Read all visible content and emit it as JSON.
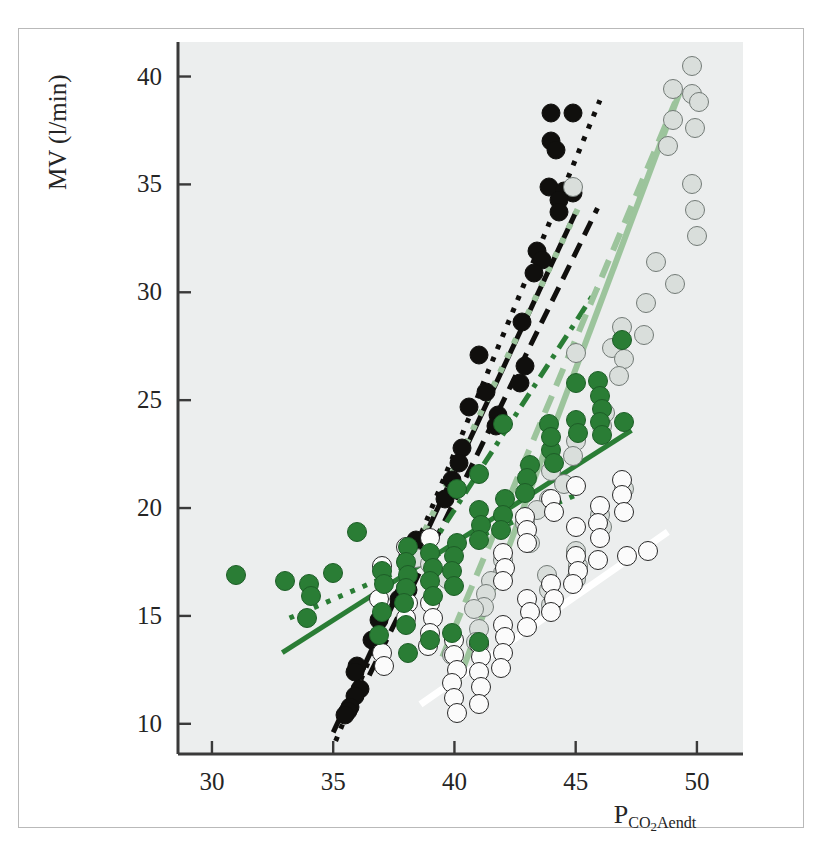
{
  "chart_data": {
    "type": "scatter",
    "title": "",
    "xlabel": "PCO2Aendt",
    "xlabel_main": "P",
    "xlabel_sub_a": "CO",
    "xlabel_sub_num": "2",
    "xlabel_sub_b": "Aendt",
    "ylabel": "MV (l/min)",
    "xlim": [
      28.6,
      51.9
    ],
    "ylim": [
      8.6,
      41.6
    ],
    "xticks": [
      30,
      35,
      40,
      45,
      50
    ],
    "xtick_labels": [
      "30",
      "35",
      "40",
      "45",
      "50"
    ],
    "yticks": [
      10,
      15,
      20,
      25,
      30,
      35,
      40
    ],
    "ytick_labels": [
      "10",
      "15",
      "20",
      "25",
      "30",
      "35",
      "40"
    ],
    "grid": false,
    "legend": "none",
    "plot_background": "#eceeee",
    "colors": {
      "black": "#100f0d",
      "dark_green": "#2a7d35",
      "light_green": "#9cc49c",
      "grey_fill": "#d9dedb",
      "grey_edge": "#727a76",
      "open_fill": "#fbfbfb",
      "open_edge": "#272727",
      "white_line": "#ffffff",
      "frame": "#b9b9b9",
      "axis": "#3a3a3a",
      "text": "#252525"
    },
    "series": [
      {
        "name": "black-filled",
        "marker": "filled-circle",
        "color": "#100f0d",
        "points": [
          [
            44.0,
            38.3
          ],
          [
            44.9,
            38.3
          ],
          [
            44.0,
            37.0
          ],
          [
            44.2,
            36.6
          ],
          [
            43.9,
            34.9
          ],
          [
            44.5,
            34.7
          ],
          [
            44.9,
            34.6
          ],
          [
            44.3,
            34.3
          ],
          [
            44.3,
            33.7
          ],
          [
            43.4,
            31.9
          ],
          [
            43.6,
            31.5
          ],
          [
            43.3,
            30.9
          ],
          [
            42.8,
            28.6
          ],
          [
            41.0,
            27.1
          ],
          [
            42.9,
            26.6
          ],
          [
            42.7,
            25.8
          ],
          [
            41.3,
            25.4
          ],
          [
            40.6,
            24.7
          ],
          [
            41.8,
            24.3
          ],
          [
            41.7,
            23.8
          ],
          [
            40.3,
            22.8
          ],
          [
            40.2,
            22.1
          ],
          [
            39.9,
            21.3
          ],
          [
            39.6,
            20.4
          ],
          [
            38.4,
            18.5
          ],
          [
            38.1,
            17.8
          ],
          [
            38.0,
            17.5
          ],
          [
            38.1,
            16.2
          ],
          [
            37.9,
            15.9
          ],
          [
            37.7,
            15.8
          ],
          [
            36.9,
            14.8
          ],
          [
            36.6,
            13.9
          ],
          [
            36.0,
            12.7
          ],
          [
            35.9,
            12.4
          ],
          [
            36.1,
            11.6
          ],
          [
            35.9,
            11.3
          ],
          [
            35.7,
            10.8
          ],
          [
            35.6,
            10.6
          ],
          [
            35.5,
            10.4
          ]
        ]
      },
      {
        "name": "grey-filled",
        "marker": "grey-circle",
        "color": "#d9dedb",
        "points": [
          [
            49.8,
            40.5
          ],
          [
            49.0,
            39.4
          ],
          [
            49.8,
            39.2
          ],
          [
            50.1,
            38.8
          ],
          [
            49.0,
            38.0
          ],
          [
            49.9,
            37.6
          ],
          [
            48.8,
            36.8
          ],
          [
            49.8,
            35.0
          ],
          [
            44.9,
            34.9
          ],
          [
            49.9,
            33.8
          ],
          [
            50.0,
            32.6
          ],
          [
            48.3,
            31.4
          ],
          [
            49.1,
            30.4
          ],
          [
            47.9,
            29.5
          ],
          [
            46.9,
            28.4
          ],
          [
            47.8,
            28.0
          ],
          [
            46.5,
            27.4
          ],
          [
            47.0,
            26.9
          ],
          [
            46.8,
            26.1
          ],
          [
            45.0,
            27.2
          ],
          [
            46.2,
            24.4
          ],
          [
            46.1,
            23.8
          ],
          [
            45.0,
            23.1
          ],
          [
            44.9,
            22.4
          ],
          [
            44.0,
            21.7
          ],
          [
            44.5,
            21.1
          ],
          [
            43.9,
            20.4
          ],
          [
            43.4,
            19.9
          ],
          [
            42.9,
            19.3
          ],
          [
            43.1,
            18.4
          ],
          [
            42.0,
            17.6
          ],
          [
            42.0,
            17.0
          ],
          [
            41.5,
            16.6
          ],
          [
            41.3,
            16.0
          ],
          [
            41.2,
            15.4
          ],
          [
            40.8,
            15.3
          ],
          [
            41.0,
            14.4
          ],
          [
            40.9,
            13.8
          ],
          [
            39.9,
            13.2
          ],
          [
            43.8,
            16.9
          ],
          [
            43.9,
            16.2
          ],
          [
            44.0,
            15.5
          ],
          [
            45.0,
            18.0
          ],
          [
            45.1,
            17.3
          ],
          [
            45.0,
            16.7
          ],
          [
            46.0,
            19.7
          ],
          [
            46.1,
            19.1
          ],
          [
            47.0,
            20.9
          ],
          [
            38.4,
            17.7
          ],
          [
            39.0,
            17.4
          ],
          [
            39.7,
            16.7
          ]
        ]
      },
      {
        "name": "open-circle",
        "marker": "open-circle",
        "color": "#fbfbfb",
        "points": [
          [
            46.9,
            21.3
          ],
          [
            46.9,
            20.6
          ],
          [
            46.0,
            20.1
          ],
          [
            47.0,
            19.8
          ],
          [
            45.9,
            19.3
          ],
          [
            46.0,
            18.6
          ],
          [
            48.0,
            18.0
          ],
          [
            45.0,
            17.8
          ],
          [
            45.1,
            17.1
          ],
          [
            44.9,
            16.5
          ],
          [
            44.0,
            16.5
          ],
          [
            44.1,
            15.8
          ],
          [
            44.0,
            15.2
          ],
          [
            43.0,
            15.8
          ],
          [
            43.1,
            15.2
          ],
          [
            43.0,
            14.5
          ],
          [
            42.0,
            14.6
          ],
          [
            42.1,
            14.0
          ],
          [
            42.0,
            13.3
          ],
          [
            41.9,
            12.6
          ],
          [
            41.0,
            13.7
          ],
          [
            41.1,
            13.1
          ],
          [
            41.0,
            12.4
          ],
          [
            41.1,
            11.7
          ],
          [
            41.0,
            10.9
          ],
          [
            40.0,
            13.9
          ],
          [
            40.0,
            13.2
          ],
          [
            40.1,
            12.5
          ],
          [
            39.9,
            11.9
          ],
          [
            40.0,
            11.2
          ],
          [
            40.1,
            10.5
          ],
          [
            39.0,
            15.6
          ],
          [
            39.1,
            14.9
          ],
          [
            39.0,
            14.2
          ],
          [
            38.9,
            13.6
          ],
          [
            38.0,
            16.3
          ],
          [
            38.1,
            15.6
          ],
          [
            38.0,
            14.9
          ],
          [
            37.0,
            17.3
          ],
          [
            36.9,
            15.8
          ],
          [
            37.0,
            13.3
          ],
          [
            37.1,
            12.7
          ],
          [
            38.0,
            18.2
          ],
          [
            39.0,
            18.6
          ],
          [
            42.9,
            19.6
          ],
          [
            43.0,
            19.0
          ],
          [
            44.0,
            20.4
          ],
          [
            44.1,
            19.8
          ],
          [
            45.0,
            21.0
          ],
          [
            42.0,
            17.9
          ],
          [
            42.1,
            17.2
          ],
          [
            42.0,
            16.6
          ],
          [
            43.0,
            18.4
          ],
          [
            45.9,
            17.6
          ],
          [
            45.0,
            19.1
          ],
          [
            47.1,
            17.8
          ]
        ]
      },
      {
        "name": "dark-green-filled",
        "marker": "dark-green-circle",
        "color": "#2a7d35",
        "points": [
          [
            46.9,
            27.8
          ],
          [
            45.9,
            25.9
          ],
          [
            45.0,
            25.8
          ],
          [
            46.0,
            25.2
          ],
          [
            46.1,
            24.6
          ],
          [
            46.0,
            24.0
          ],
          [
            46.1,
            23.4
          ],
          [
            45.0,
            24.1
          ],
          [
            45.1,
            23.5
          ],
          [
            44.0,
            22.7
          ],
          [
            44.1,
            22.1
          ],
          [
            43.1,
            22.0
          ],
          [
            43.0,
            21.4
          ],
          [
            42.9,
            20.7
          ],
          [
            42.1,
            20.4
          ],
          [
            42.0,
            19.7
          ],
          [
            41.9,
            19.0
          ],
          [
            41.0,
            19.9
          ],
          [
            41.1,
            19.2
          ],
          [
            41.0,
            18.5
          ],
          [
            40.1,
            18.4
          ],
          [
            40.0,
            17.8
          ],
          [
            39.9,
            17.1
          ],
          [
            40.0,
            16.4
          ],
          [
            39.0,
            17.9
          ],
          [
            39.1,
            17.2
          ],
          [
            39.0,
            16.6
          ],
          [
            39.1,
            15.9
          ],
          [
            38.1,
            18.2
          ],
          [
            38.0,
            17.5
          ],
          [
            38.1,
            16.9
          ],
          [
            38.0,
            16.3
          ],
          [
            37.9,
            15.6
          ],
          [
            37.0,
            17.1
          ],
          [
            37.1,
            16.5
          ],
          [
            37.0,
            15.2
          ],
          [
            36.0,
            18.9
          ],
          [
            35.0,
            17.0
          ],
          [
            34.0,
            16.5
          ],
          [
            34.1,
            15.9
          ],
          [
            33.9,
            14.9
          ],
          [
            33.0,
            16.6
          ],
          [
            31.0,
            16.9
          ],
          [
            42.0,
            23.9
          ],
          [
            41.0,
            21.6
          ],
          [
            43.9,
            23.9
          ],
          [
            44.0,
            23.3
          ],
          [
            40.1,
            20.9
          ],
          [
            47.0,
            24.0
          ],
          [
            38.0,
            14.6
          ],
          [
            38.1,
            13.3
          ],
          [
            39.0,
            13.9
          ],
          [
            39.9,
            14.2
          ],
          [
            41.0,
            13.8
          ],
          [
            36.9,
            14.1
          ]
        ]
      }
    ],
    "trend_lines": [
      {
        "name": "black-dotted",
        "style": "dotted",
        "color": "#100f0d",
        "x0": 35.1,
        "y0": 9.2,
        "x1": 46.0,
        "y1": 38.9
      },
      {
        "name": "black-solid",
        "style": "solid",
        "color": "#100f0d",
        "x0": 35.0,
        "y0": 9.6,
        "x1": 45.0,
        "y1": 33.7
      },
      {
        "name": "black-dashed",
        "style": "dashed",
        "color": "#100f0d",
        "x0": 35.6,
        "y0": 10.2,
        "x1": 45.9,
        "y1": 33.9
      },
      {
        "name": "dark-green-dotted",
        "style": "dotted",
        "color": "#2a7d35",
        "x0": 33.2,
        "y0": 14.9,
        "x1": 45.0,
        "y1": 20.6
      },
      {
        "name": "dark-green-solid",
        "style": "solid",
        "color": "#2a7d35",
        "x0": 32.9,
        "y0": 13.3,
        "x1": 47.3,
        "y1": 23.6
      },
      {
        "name": "dark-green-dashdot",
        "style": "dashdot",
        "color": "#2a7d35",
        "x0": 38.9,
        "y0": 18.0,
        "x1": 45.9,
        "y1": 30.2
      },
      {
        "name": "light-green-dotted",
        "style": "dotted",
        "color": "#9cc49c",
        "x0": 38.5,
        "y0": 18.3,
        "x1": 45.1,
        "y1": 33.9
      },
      {
        "name": "light-green-solid",
        "style": "solid",
        "color": "#9cc49c",
        "x0": 39.9,
        "y0": 11.2,
        "x1": 49.3,
        "y1": 39.3
      },
      {
        "name": "light-green-dashed",
        "style": "dashed",
        "color": "#9cc49c",
        "x0": 39.5,
        "y0": 13.1,
        "x1": 49.1,
        "y1": 38.8
      },
      {
        "name": "white-solid",
        "style": "solid",
        "color": "#ffffff",
        "x0": 38.6,
        "y0": 10.9,
        "x1": 48.8,
        "y1": 18.9
      }
    ]
  }
}
